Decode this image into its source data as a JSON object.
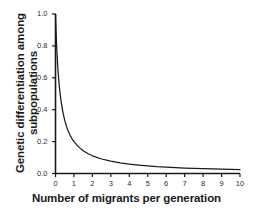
{
  "chart_data": {
    "type": "line",
    "title": "",
    "xlabel": "Number of migrants per generation",
    "ylabel": "Genetic differentiation among subpopulations",
    "ylabel_lines": [
      "Genetic differentiation among",
      "subpopulations"
    ],
    "xlim": [
      0,
      10
    ],
    "ylim": [
      0.0,
      1.0
    ],
    "grid": false,
    "legend": null,
    "line_color": "#1a1a1a",
    "background_color": "#ffffff",
    "axis_color": "#1a1a1a",
    "formula": "Fst = 1 / (1 + 4Nm)",
    "xticks": [
      "0",
      "1",
      "2",
      "3",
      "4",
      "5",
      "6",
      "7",
      "8",
      "9",
      "10"
    ],
    "xtick_values": [
      0,
      1,
      2,
      3,
      4,
      5,
      6,
      7,
      8,
      9,
      10
    ],
    "yticks": [
      "0.0",
      "0.2",
      "0.4",
      "0.6",
      "0.8",
      "1.0"
    ],
    "ytick_values": [
      0.0,
      0.2,
      0.4,
      0.6,
      0.8,
      1.0
    ],
    "x": [
      0,
      0.02,
      0.05,
      0.08,
      0.12,
      0.16,
      0.2,
      0.25,
      0.3,
      0.4,
      0.5,
      0.6,
      0.7,
      0.8,
      0.9,
      1.0,
      1.25,
      1.5,
      1.75,
      2.0,
      2.5,
      3.0,
      3.5,
      4.0,
      4.5,
      5.0,
      5.5,
      6.0,
      6.5,
      7.0,
      7.5,
      8.0,
      8.5,
      9.0,
      9.5,
      10.0
    ],
    "values": [
      1.0,
      0.926,
      0.833,
      0.758,
      0.676,
      0.61,
      0.556,
      0.5,
      0.455,
      0.385,
      0.333,
      0.294,
      0.263,
      0.238,
      0.217,
      0.2,
      0.167,
      0.143,
      0.125,
      0.111,
      0.091,
      0.077,
      0.067,
      0.059,
      0.053,
      0.048,
      0.043,
      0.04,
      0.037,
      0.034,
      0.032,
      0.03,
      0.029,
      0.027,
      0.026,
      0.024
    ]
  }
}
